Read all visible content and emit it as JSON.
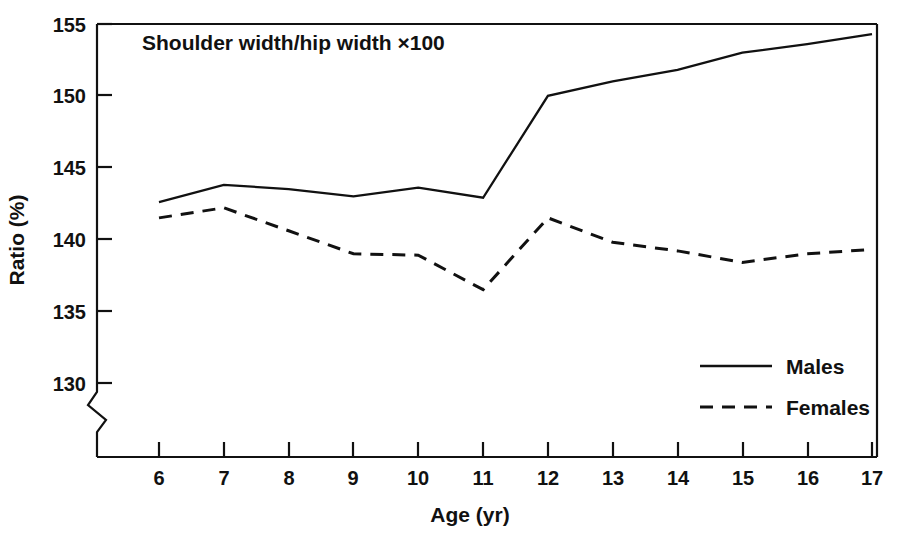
{
  "chart_data": {
    "type": "line",
    "title": "",
    "annotation": "Shoulder width/hip width ×100",
    "xlabel": "Age (yr)",
    "ylabel": "Ratio (%)",
    "x": [
      6,
      7,
      8,
      9,
      10,
      11,
      12,
      13,
      14,
      15,
      16,
      17
    ],
    "categories": [
      "6",
      "7",
      "8",
      "9",
      "10",
      "11",
      "12",
      "13",
      "14",
      "15",
      "16",
      "17"
    ],
    "xtick_labels": [
      "6",
      "7",
      "8",
      "9",
      "10",
      "11",
      "12",
      "13",
      "14",
      "15",
      "16",
      "17"
    ],
    "ytick_labels": [
      "130",
      "135",
      "140",
      "145",
      "150",
      "155"
    ],
    "yticks": [
      130,
      135,
      140,
      145,
      150,
      155
    ],
    "ylim": [
      130,
      155
    ],
    "xlim": [
      6,
      17
    ],
    "y_axis_break": true,
    "y_axis_break_note": "zigzag break below 130",
    "grid": false,
    "legend_position": "inside-lower-right",
    "series": [
      {
        "name": "Males",
        "style": "solid",
        "color": "#111111",
        "values": [
          142.6,
          143.8,
          143.5,
          143.0,
          143.6,
          142.9,
          150.0,
          151.0,
          151.8,
          153.0,
          153.6,
          154.3
        ]
      },
      {
        "name": "Females",
        "style": "dashed",
        "color": "#111111",
        "values": [
          141.5,
          142.2,
          140.6,
          139.0,
          138.9,
          136.5,
          141.5,
          139.8,
          139.2,
          138.4,
          139.0,
          139.3
        ]
      }
    ]
  },
  "legend": {
    "males_label": "Males",
    "females_label": "Females"
  },
  "axes": {
    "x_title": "Age (yr)",
    "y_title": "Ratio (%)"
  },
  "annotation": {
    "text": "Shoulder width/hip width ×100"
  }
}
